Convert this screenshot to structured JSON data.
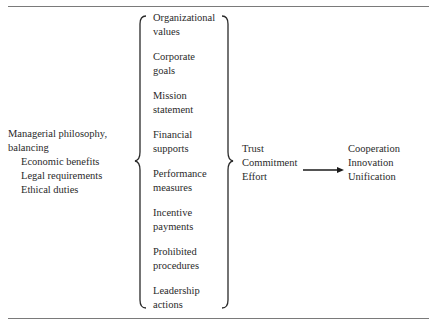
{
  "diagram": {
    "type": "brace-flow",
    "left": {
      "heading_line1": "Managerial philosophy,",
      "heading_line2": "balancing",
      "subitems": [
        "Economic benefits",
        "Legal requirements",
        "Ethical duties"
      ]
    },
    "middle": {
      "items": [
        "Organizational\nvalues",
        "Corporate\ngoals",
        "Mission\nstatement",
        "Financial\nsupports",
        "Performance\nmeasures",
        "Incentive\npayments",
        "Prohibited\nprocedures",
        "Leadership\nactions"
      ]
    },
    "right": {
      "items": [
        "Trust",
        "Commitment",
        "Effort"
      ]
    },
    "result": {
      "items": [
        "Cooperation",
        "Innovation",
        "Unification"
      ]
    },
    "colors": {
      "text": "#2a2a2a",
      "rule": "#7a7a7a",
      "brace": "#2a2a2a"
    }
  }
}
